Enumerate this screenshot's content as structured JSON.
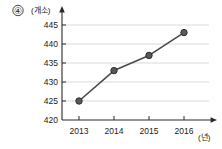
{
  "item_number": "④",
  "chart_data": {
    "type": "line",
    "title": "",
    "xlabel": "(년)",
    "ylabel": "(개소)",
    "categories": [
      "2013",
      "2014",
      "2015",
      "2016"
    ],
    "values": [
      425,
      433,
      437,
      443
    ],
    "series": [
      {
        "name": "",
        "values": [
          425,
          433,
          437,
          443
        ]
      }
    ],
    "ylim": [
      420,
      447
    ],
    "xlim": [
      2012.6,
      2016.6
    ],
    "y_ticks": [
      "420",
      "425",
      "430",
      "435",
      "440",
      "445"
    ],
    "y_tick_values": [
      420,
      425,
      430,
      435,
      440,
      445
    ],
    "x_ticks": [
      "2013",
      "2014",
      "2015",
      "2016"
    ],
    "grid": true,
    "grid_axis": "y",
    "legend": false,
    "legend_position": "none",
    "marker": "circle",
    "annotations": []
  },
  "colors": {
    "line": "#4a4a4a",
    "marker_fill": "#585858",
    "marker_stroke": "#2e2e2e",
    "grid": "#c9c9c9",
    "axis": "#2b2b2b",
    "text": "#1a1a1a",
    "background": "#ffffff"
  }
}
